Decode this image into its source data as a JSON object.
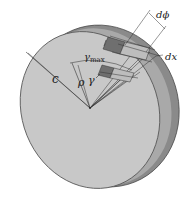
{
  "figure": {
    "labels": {
      "radius_outer": "c",
      "radius_inner": "ρ",
      "shear_strain": "γ",
      "shear_strain_max": "γ",
      "shear_strain_max_sub": "max",
      "angle_increment": "dϕ",
      "length_increment": "dx"
    },
    "colors": {
      "face": "#c8c8c8",
      "rim": "#8a8a8a",
      "rim_inner": "#a9a9a9",
      "element_dark": "#6f6f6f",
      "element_light": "#bdbdbd",
      "line": "#333333",
      "background": "#ffffff"
    }
  }
}
